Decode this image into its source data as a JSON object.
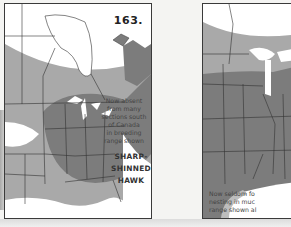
{
  "figure": {
    "number": "163."
  },
  "left_map": {
    "note_lines": [
      "Now absent",
      "from many",
      "sections south",
      "of Canada",
      "in breeding",
      "range shown"
    ],
    "species_lines": [
      "SHARP-",
      "SHINNED",
      "HAWK"
    ],
    "legend": {
      "light_shade": "range (absent in many areas)",
      "dark_shade": "breeding range shown"
    }
  },
  "right_map": {
    "note_lines": [
      "Now seldom fo",
      "nesting in muc",
      "range shown al"
    ]
  },
  "colors": {
    "paper": "#ffffff",
    "light_range": "#a9a9a9",
    "dark_range": "#7c7c7c",
    "borders": "#333333",
    "water": "#ffffff"
  }
}
